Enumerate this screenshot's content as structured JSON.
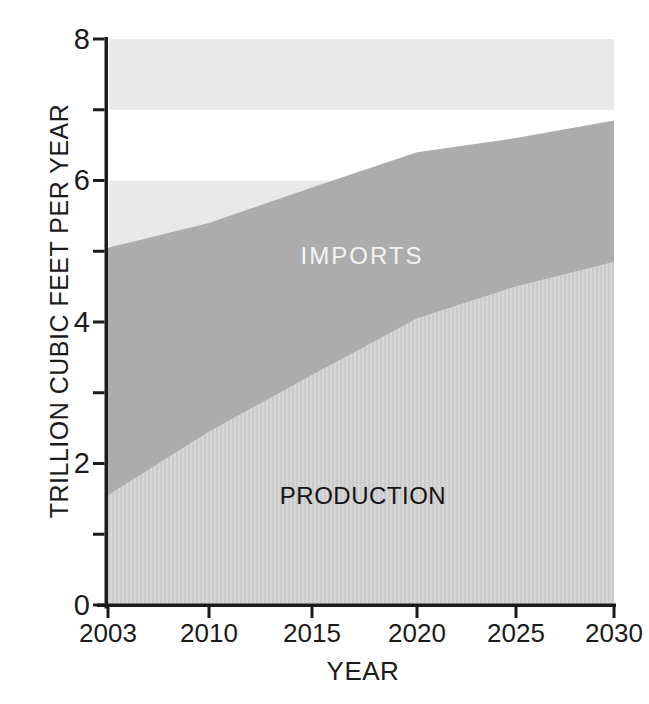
{
  "figure": {
    "background_color": "#ffffff",
    "axis_color": "#1b1b1b",
    "text_color": "#1b1b1b"
  },
  "chart_data": {
    "type": "area",
    "stacked": true,
    "title": "",
    "xlabel": "YEAR",
    "ylabel": "TRILLION CUBIC FEET PER YEAR",
    "x_categories": [
      "2003",
      "2010",
      "2015",
      "2020",
      "2025",
      "2030"
    ],
    "series": [
      {
        "name": "production",
        "label": "PRODUCTION",
        "values": [
          1.55,
          2.45,
          3.25,
          4.05,
          4.5,
          4.85
        ],
        "fill": "#d2d2d2",
        "texture": "vertical-stripes",
        "stripe_colors": [
          "#d6d6d6",
          "#cbcbcb"
        ],
        "label_color": "#141414"
      },
      {
        "name": "imports",
        "label": "IMPORTS",
        "values": [
          3.5,
          2.95,
          2.65,
          2.35,
          2.1,
          2.0
        ],
        "fill": "#acacac",
        "texture": "solid",
        "label_color": "#f4f4f4"
      }
    ],
    "stacked_totals": [
      5.05,
      5.4,
      5.9,
      6.4,
      6.6,
      6.85
    ],
    "ylim": [
      0,
      8
    ],
    "y_major_ticks": [
      0,
      2,
      4,
      6,
      8
    ],
    "y_minor_ticks": [
      1,
      3,
      5,
      7
    ],
    "grid": "off",
    "legend": "labels-inside-areas",
    "background_bands": {
      "color": "#e9e9e9",
      "value_ranges": [
        [
          1,
          2
        ],
        [
          3,
          4
        ],
        [
          5,
          6
        ],
        [
          7,
          8
        ]
      ]
    }
  }
}
